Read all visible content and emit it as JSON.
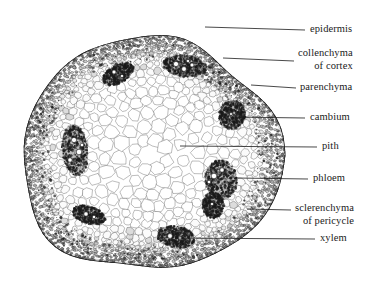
{
  "figure": {
    "specimen_shape": "rounded-polygonal stem cross-section",
    "background_color": "#ffffff",
    "ink_color": "#1a1a1a"
  },
  "labels": [
    {
      "id": "epidermis",
      "line1": "epidermis",
      "line2": "",
      "text_x": 310,
      "text_y": 32,
      "leader": [
        205,
        27,
        305,
        30
      ]
    },
    {
      "id": "collenchyma",
      "line1": "collenchyma",
      "line2": "of cortex",
      "text_x": 298,
      "text_y": 56,
      "leader": [
        223,
        58,
        294,
        61
      ]
    },
    {
      "id": "parenchyma",
      "line1": "parenchyma",
      "line2": "",
      "text_x": 300,
      "text_y": 90,
      "leader": [
        251,
        85,
        296,
        88
      ]
    },
    {
      "id": "cambium",
      "line1": "cambium",
      "line2": "",
      "text_x": 310,
      "text_y": 120,
      "leader": [
        232,
        117,
        305,
        118
      ]
    },
    {
      "id": "pith",
      "line1": "pith",
      "line2": "",
      "text_x": 322,
      "text_y": 149,
      "leader": [
        180,
        146,
        317,
        147
      ]
    },
    {
      "id": "phloem",
      "line1": "phloem",
      "line2": "",
      "text_x": 313,
      "text_y": 181,
      "leader": [
        236,
        178,
        308,
        179
      ]
    },
    {
      "id": "sclerenchyma",
      "line1": "sclerenchyma",
      "line2": "of pericycle",
      "text_x": 295,
      "text_y": 211,
      "leader": [
        247,
        209,
        291,
        210
      ]
    },
    {
      "id": "xylem",
      "line1": "xylem",
      "line2": "",
      "text_x": 320,
      "text_y": 241,
      "leader": [
        175,
        238,
        315,
        239
      ]
    }
  ],
  "tissues": {
    "epidermis": "outermost single layer of small dark cells",
    "collenchyma_of_cortex": "dark thick-walled cells beneath epidermis",
    "parenchyma": "cortex ground tissue of moderate cells",
    "cambium": "thin meristem layer within vascular bundle",
    "pith": "large pale rounded cells filling the centre",
    "phloem": "dark tissue on outer side of each bundle",
    "sclerenchyma_of_pericycle": "dark fibre cap outside each bundle",
    "xylem": "vessels with large white lumens on inner side of bundle"
  },
  "bundles": [
    {
      "cx": 118,
      "cy": 74,
      "rx": 17,
      "ry": 9,
      "rot": -28,
      "lumens": [
        [
          114,
          72,
          2.0
        ],
        [
          122,
          76,
          1.6
        ]
      ]
    },
    {
      "cx": 185,
      "cy": 66,
      "rx": 22,
      "ry": 11,
      "rot": 6,
      "lumens": [
        [
          176,
          64,
          2.6
        ],
        [
          184,
          69,
          2.4
        ],
        [
          192,
          65,
          2.0
        ],
        [
          188,
          61,
          1.6
        ]
      ]
    },
    {
      "cx": 232,
      "cy": 115,
      "rx": 13,
      "ry": 15,
      "rot": 18,
      "lumens": [
        [
          231,
          114,
          1.5
        ]
      ]
    },
    {
      "cx": 221,
      "cy": 180,
      "rx": 16,
      "ry": 20,
      "rot": -8,
      "lumens": [
        [
          214,
          176,
          2.8
        ],
        [
          222,
          170,
          2.2
        ],
        [
          209,
          182,
          1.8
        ]
      ]
    },
    {
      "cx": 213,
      "cy": 205,
      "rx": 11,
      "ry": 13,
      "rot": 0,
      "lumens": [
        [
          212,
          204,
          1.6
        ]
      ]
    },
    {
      "cx": 176,
      "cy": 237,
      "rx": 19,
      "ry": 11,
      "rot": 10,
      "lumens": [
        [
          170,
          236,
          2.4
        ],
        [
          180,
          238,
          1.8
        ]
      ]
    },
    {
      "cx": 89,
      "cy": 215,
      "rx": 17,
      "ry": 9,
      "rot": 18,
      "lumens": [
        [
          86,
          214,
          2.2
        ],
        [
          94,
          217,
          1.7
        ]
      ]
    },
    {
      "cx": 75,
      "cy": 150,
      "rx": 13,
      "ry": 26,
      "rot": -6,
      "lumens": [
        [
          74,
          140,
          2.6
        ],
        [
          79,
          152,
          2.8
        ],
        [
          70,
          160,
          2.2
        ],
        [
          82,
          145,
          1.8
        ]
      ]
    }
  ]
}
